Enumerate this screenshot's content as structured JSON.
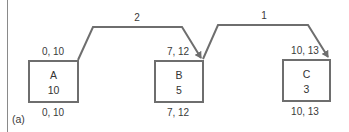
{
  "figure_label": "(a)",
  "colors": {
    "stroke": "#6e6e6e",
    "text": "#333333"
  },
  "nodes": [
    {
      "id": "A",
      "name": "A",
      "duration": "10",
      "early": "0, 10",
      "late": "0, 10"
    },
    {
      "id": "B",
      "name": "B",
      "duration": "5",
      "early": "7, 12",
      "late": "7, 12"
    },
    {
      "id": "C",
      "name": "C",
      "duration": "3",
      "early": "10, 13",
      "late": "10, 13"
    }
  ],
  "edges": [
    {
      "from": "A",
      "to": "B",
      "lag": "2"
    },
    {
      "from": "B",
      "to": "C",
      "lag": "1"
    }
  ]
}
